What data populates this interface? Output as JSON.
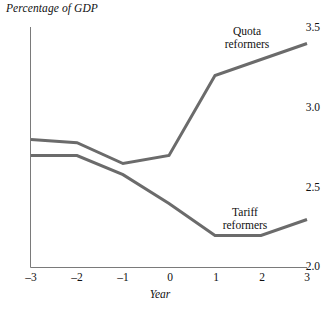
{
  "chart_data": {
    "type": "line",
    "title": "",
    "ylabel": "Percentage of GDP",
    "xlabel": "Year",
    "x": [
      -3,
      -2,
      -1,
      0,
      1,
      2,
      3
    ],
    "xtick_labels": [
      "–3",
      "–2",
      "–1",
      "0",
      "1",
      "2",
      "3"
    ],
    "ytick_labels": [
      "2.0",
      "2.5",
      "3.0",
      "3.5"
    ],
    "yticks": [
      2.0,
      2.5,
      3.0,
      3.5
    ],
    "ylim": [
      2.0,
      3.5
    ],
    "xlim": [
      -3,
      3
    ],
    "grid": false,
    "legend_position": "inline-annotations",
    "line_color": "#6b6b6b",
    "axis_color": "#7a7a7a",
    "series": [
      {
        "name": "Quota reformers",
        "label_line1": "Quota",
        "label_line2": "reformers",
        "values": [
          2.8,
          2.78,
          2.65,
          2.7,
          3.2,
          3.3,
          3.4
        ]
      },
      {
        "name": "Tariff reformers",
        "label_line1": "Tariff",
        "label_line2": "reformers",
        "values": [
          2.7,
          2.7,
          2.58,
          2.4,
          2.2,
          2.2,
          2.3
        ]
      }
    ]
  }
}
